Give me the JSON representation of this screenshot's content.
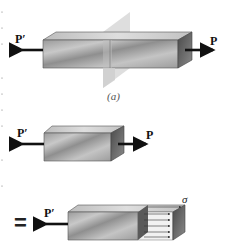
{
  "figure": {
    "panel_a": {
      "left_force_label": "P′",
      "right_force_label": "P",
      "caption": "(a)",
      "has_cutting_plane": true
    },
    "panel_b": {
      "left_force_label": "P′",
      "right_force_label": "P"
    },
    "panel_c": {
      "equals_sign": "=",
      "left_force_label": "P′",
      "stress_label": "σ",
      "stress_arrow_count": 5
    },
    "colors": {
      "bar_front": "#a8a8a8",
      "bar_top": "#cfcfcf",
      "bar_side": "#6e6e6e",
      "plane": "#d6d6d6",
      "arrow": "#111111"
    }
  }
}
